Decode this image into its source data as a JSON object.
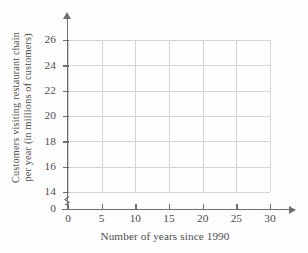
{
  "chart_data": {
    "type": "scatter",
    "title": "",
    "subtitle": "",
    "xlabel": "Number of years since 1990",
    "ylabel": "Customers visiting restaurant chain per year (in millions of customers)",
    "ylabel_line1": "Customers visiting restaurant chain",
    "ylabel_line2": "per year (in millions of customers)",
    "x_ticks": [
      0,
      5,
      10,
      15,
      20,
      25,
      30
    ],
    "x_tick_labels": [
      "0",
      "5",
      "10",
      "15",
      "20",
      "25",
      "30"
    ],
    "y_ticks": [
      14,
      16,
      18,
      20,
      22,
      24,
      26
    ],
    "y_tick_labels": [
      "14",
      "16",
      "18",
      "20",
      "22",
      "24",
      "26"
    ],
    "y_origin_label": "0",
    "xlim": [
      0,
      30
    ],
    "ylim": [
      14,
      26
    ],
    "y_axis_break": true,
    "grid": true,
    "legend": null,
    "series": [],
    "values": [],
    "annotations": []
  },
  "style": {
    "grid_color": "#d4d4d4",
    "axis_color": "#6f6f6f",
    "text_color": "#4d4d4d",
    "background": "#fefefe"
  },
  "icons": {
    "y_axis_arrow": "arrow-up-icon",
    "x_axis_arrow": "arrow-right-icon",
    "y_axis_break": "axis-break-icon"
  }
}
